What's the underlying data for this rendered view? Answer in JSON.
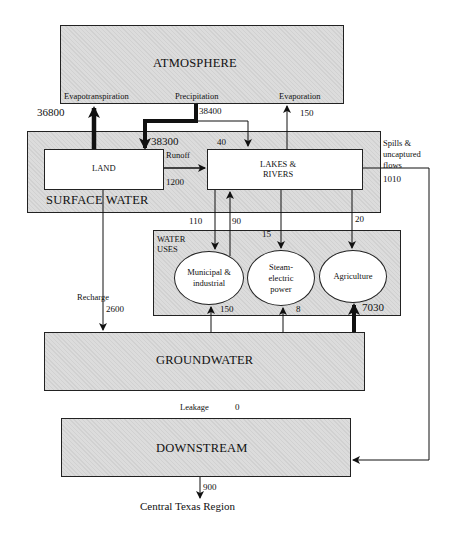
{
  "diagram": {
    "nodes": {
      "atmosphere": "ATMOSPHERE",
      "surface_water": "SURFACE WATER",
      "land": "LAND",
      "lakes_rivers_line1": "LAKES &",
      "lakes_rivers_line2": "RIVERS",
      "water_uses_line1": "WATER",
      "water_uses_line2": "USES",
      "municipal_line1": "Municipal &",
      "municipal_line2": "industrial",
      "steam_line1": "Steam-",
      "steam_line2": "electric",
      "steam_line3": "power",
      "agriculture": "Agriculture",
      "groundwater": "GROUNDWATER",
      "downstream": "DOWNSTREAM",
      "central_texas": "Central Texas Region"
    },
    "flow_labels": {
      "evapotranspiration": "Evapotranspiration",
      "precipitation": "Precipitation",
      "evaporation": "Evaporation",
      "runoff": "Runoff",
      "spills_line1": "Spills &",
      "spills_line2": "uncaptured",
      "spills_line3": "flows",
      "recharge": "Recharge",
      "leakage": "Leakage"
    },
    "flow_values": {
      "evapotranspiration": "36800",
      "precipitation": "38400",
      "precip_to_land": "38300",
      "precip_to_lakes": "40",
      "evaporation": "150",
      "runoff": "1200",
      "spills": "1010",
      "lakes_to_municipal": "110",
      "municipal_return": "90",
      "lakes_to_steam": "15",
      "lakes_to_agriculture": "20",
      "recharge": "2600",
      "gw_to_municipal": "150",
      "gw_to_steam": "8",
      "gw_to_agriculture": "7030",
      "leakage": "0",
      "downstream_out": "900"
    }
  }
}
